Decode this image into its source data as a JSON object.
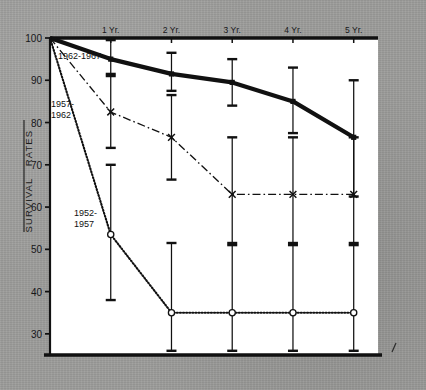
{
  "figure": {
    "background_color": "#9d9d9b",
    "plot_background_color": "#ffffff",
    "ink_color": "#111111"
  },
  "axis": {
    "y_label_line1": "SURVIVAL",
    "y_label_line2": "RATES",
    "y_ticks": [
      "100",
      "90",
      "80",
      "70",
      "60",
      "50",
      "40",
      "30"
    ],
    "x_ticks": [
      "1 Yr.",
      "2 Yr.",
      "3 Yr.",
      "4 Yr.",
      "5 Yr."
    ]
  },
  "annotations": {
    "series_c_label": "1962-1967",
    "series_b_label_line1": "1957-",
    "series_b_label_line2": "1962",
    "series_a_label_line1": "1952-",
    "series_a_label_line2": "1957"
  },
  "chart_data": {
    "type": "line",
    "title": "",
    "xlabel": "",
    "ylabel": "SURVIVAL RATES",
    "x": [
      0,
      1,
      2,
      3,
      4,
      5
    ],
    "x_tick_labels": [
      "",
      "1 Yr.",
      "2 Yr.",
      "3 Yr.",
      "4 Yr.",
      "5 Yr."
    ],
    "xlim": [
      0,
      5.4
    ],
    "ylim": [
      25,
      100
    ],
    "y_ticks": [
      100,
      90,
      80,
      70,
      60,
      50,
      40,
      30
    ],
    "grid": false,
    "legend_position": "inline-annotations",
    "error_bars": "vertical, flat caps (95% confidence intervals)",
    "series": [
      {
        "name": "1962-1967",
        "line_style": "solid-thick",
        "marker": "filled-square",
        "values": [
          100,
          95,
          91.5,
          89.5,
          85,
          76.5
        ],
        "err_low": [
          null,
          91.5,
          87.5,
          84,
          77.5,
          62.5
        ],
        "err_high": [
          null,
          99.5,
          96.5,
          95,
          93,
          90
        ]
      },
      {
        "name": "1957-1962",
        "line_style": "dash-dot",
        "marker": "cross",
        "values": [
          100,
          82.5,
          76.5,
          63,
          63,
          63
        ],
        "err_low": [
          null,
          74,
          66.5,
          51,
          51,
          51
        ],
        "err_high": [
          null,
          91,
          86.5,
          76.5,
          76.5,
          76.5
        ]
      },
      {
        "name": "1952-1957",
        "line_style": "dotted",
        "marker": "open-circle",
        "values": [
          100,
          53.5,
          35,
          35,
          35,
          35
        ],
        "err_low": [
          null,
          38,
          26,
          26,
          26,
          26
        ],
        "err_high": [
          null,
          70,
          51.5,
          51.5,
          51.5,
          51.5
        ]
      }
    ]
  }
}
